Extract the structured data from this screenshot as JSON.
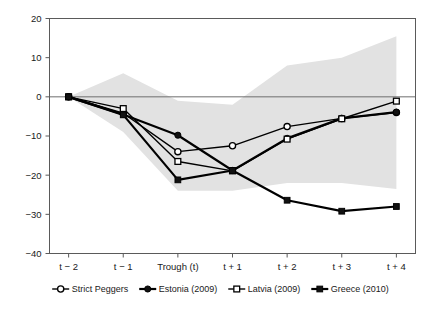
{
  "chart_data": {
    "type": "line",
    "title": "",
    "subtitle": "",
    "xlabel": "",
    "ylabel": "",
    "grid": false,
    "legend_position": "bottom",
    "categories": [
      "t − 2",
      "t − 1",
      "Trough (t)",
      "t + 1",
      "t + 2",
      "t + 3",
      "t + 4"
    ],
    "x": [
      0,
      1,
      2,
      3,
      4,
      5,
      6
    ],
    "xlim": [
      -0.35,
      6.35
    ],
    "ylim": [
      -40,
      20
    ],
    "yticks": [
      20,
      10,
      0,
      -10,
      -20,
      -30,
      -40
    ],
    "ytick_labels": [
      "20",
      "10",
      "0",
      "−10",
      "−20",
      "−30",
      "−40"
    ],
    "zero_line": 0,
    "band": {
      "name": "Strict Peggers range",
      "fill": "#e2e2e2",
      "upper": [
        0,
        6.0,
        -1.0,
        -2.0,
        8.0,
        10.0,
        15.5
      ],
      "lower": [
        0,
        -9.0,
        -24.0,
        -24.0,
        -22.0,
        -22.0,
        -23.5
      ]
    },
    "series": [
      {
        "name": "Strict Peggers",
        "marker": "open-circle",
        "color": "#000000",
        "line_width": 1.4,
        "values": [
          0,
          -4.2,
          -14.0,
          -12.5,
          -7.6,
          -5.5,
          -4.0
        ]
      },
      {
        "name": "Estonia (2009)",
        "marker": "filled-circle",
        "color": "#000000",
        "line_width": 2.2,
        "values": [
          0,
          -4.5,
          -9.8,
          -18.8,
          -10.6,
          -5.5,
          -3.9
        ]
      },
      {
        "name": "Latvia (2009)",
        "marker": "open-square",
        "color": "#000000",
        "line_width": 1.4,
        "values": [
          0,
          -3.0,
          -16.5,
          -18.9,
          -10.8,
          -5.6,
          -1.1
        ]
      },
      {
        "name": "Greece (2010)",
        "marker": "filled-square",
        "color": "#000000",
        "line_width": 2.2,
        "values": [
          0,
          -4.6,
          -21.2,
          -18.8,
          -26.4,
          -29.2,
          -28.0
        ]
      }
    ]
  },
  "axis": {
    "y_labels": [
      "20",
      "10",
      "0",
      "−10",
      "−20",
      "−30",
      "−40"
    ],
    "x_labels": [
      "t − 2",
      "t − 1",
      "Trough (t)",
      "t + 1",
      "t + 2",
      "t + 3",
      "t + 4"
    ]
  },
  "legend": {
    "items": [
      {
        "label": "Strict Peggers",
        "marker": "open-circle"
      },
      {
        "label": "Estonia (2009)",
        "marker": "filled-circle"
      },
      {
        "label": "Latvia (2009)",
        "marker": "open-square"
      },
      {
        "label": "Greece (2010)",
        "marker": "filled-square"
      }
    ]
  }
}
